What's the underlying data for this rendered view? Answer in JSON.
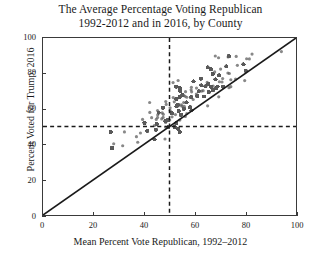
{
  "chart_data": {
    "type": "scatter",
    "title": "The Average Percentage Voting Republican 1992-2012 and in 2016, by County",
    "title_line1": "The Average Percentage Voting Republican",
    "title_line2": "1992-2012 and in 2016, by County",
    "xlabel": "Mean Percent Vote Republican, 1992–2012",
    "ylabel": "Percent Voted for Trump, 2016",
    "xlim": [
      0,
      100
    ],
    "ylim": [
      0,
      100
    ],
    "xticks": [
      0,
      20,
      40,
      60,
      80,
      100
    ],
    "yticks": [
      0,
      20,
      40,
      60,
      80,
      100
    ],
    "xtick_labels": [
      "0",
      "20",
      "40",
      "60",
      "80",
      "100"
    ],
    "ytick_labels": [
      "0",
      "20",
      "40",
      "60",
      "80",
      "100"
    ],
    "grid": false,
    "legend": null,
    "point_color": "#5a5a5a",
    "point_size": 1.6,
    "point_opacity": 0.72,
    "reference_lines": [
      {
        "name": "identity-line",
        "type": "diagonal",
        "from": [
          0,
          0
        ],
        "to": [
          100,
          100
        ],
        "style": "solid",
        "color": "#1a1a1a",
        "width": 1.6
      },
      {
        "name": "vertical-50-line",
        "type": "vertical",
        "value": 50,
        "style": "dashed",
        "color": "#1a1a1a",
        "width": 1.4
      },
      {
        "name": "horizontal-50-line",
        "type": "horizontal",
        "value": 50,
        "style": "dashed",
        "color": "#1a1a1a",
        "width": 1.4
      }
    ],
    "series": [
      {
        "name": "US counties",
        "n_points": 3110,
        "description": "Each point is a US county: mean percent Republican vote 1992-2012 (x) vs percent voted for Trump in 2016 (y). Nearly all points lie above the y=x identity line, indicating Trump outperformed the 1992-2012 Republican average in most counties.",
        "cluster_center": [
          58,
          68
        ],
        "x_range": [
          18,
          95
        ],
        "y_range": [
          4,
          96
        ],
        "correlation": 0.9
      }
    ]
  }
}
